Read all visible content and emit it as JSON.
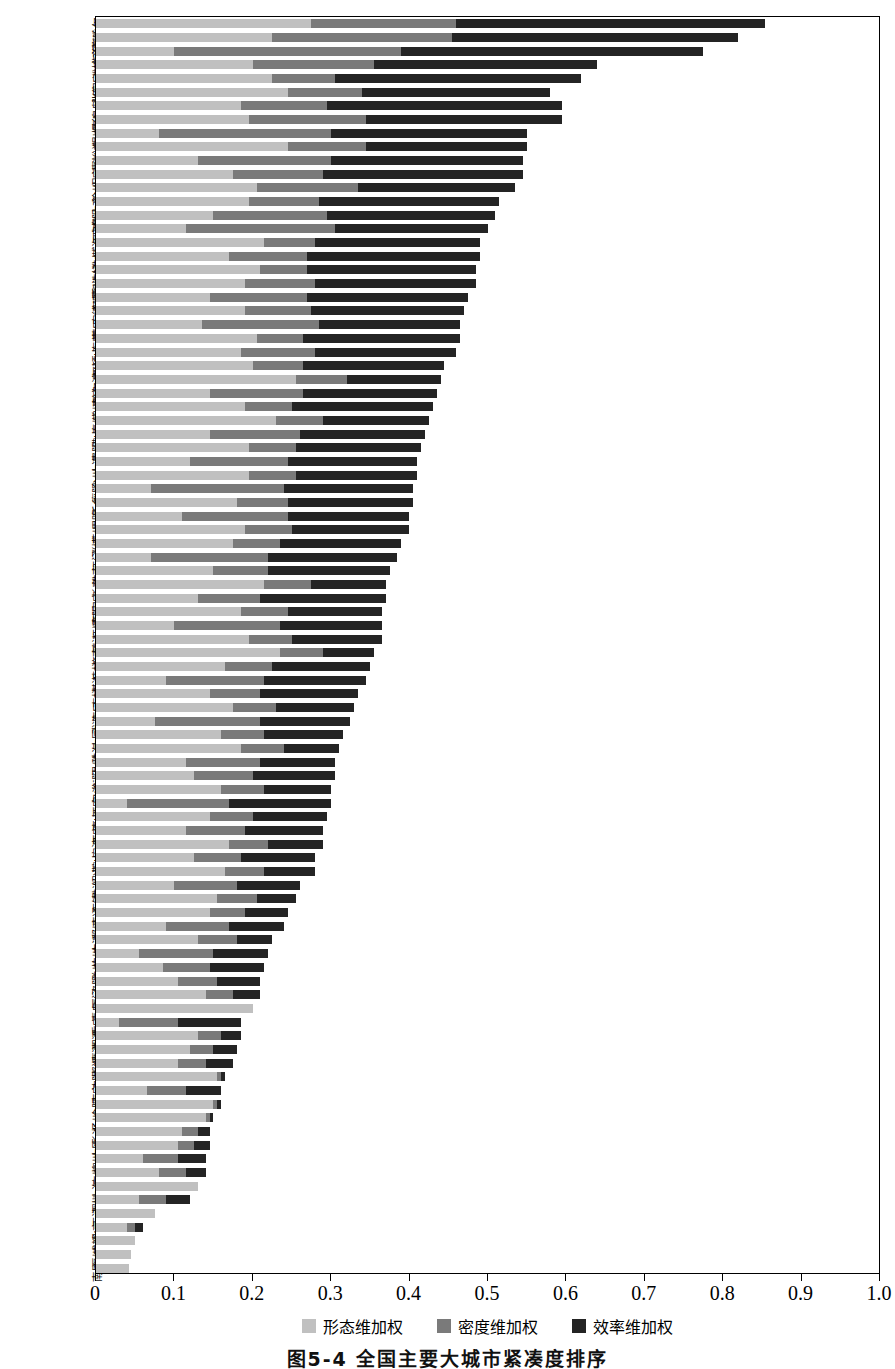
{
  "chart_data": {
    "type": "bar",
    "orientation": "horizontal",
    "stacked": true,
    "title": "图5-4 全国主要大城市紧凑度排序",
    "xlabel": "",
    "ylabel": "",
    "xlim": [
      0,
      1.0
    ],
    "grid": false,
    "legend_position": "bottom",
    "xticks": [
      "0",
      "0.1",
      "0.2",
      "0.3",
      "0.4",
      "0.5",
      "0.6",
      "0.7",
      "0.8",
      "0.9",
      "1.0"
    ],
    "xtick_values": [
      0,
      0.1,
      0.2,
      0.3,
      0.4,
      0.5,
      0.6,
      0.7,
      0.8,
      0.9,
      1.0
    ],
    "legend": [
      {
        "name": "形态维加权",
        "color": "#c0c0c0"
      },
      {
        "name": "密度维加权",
        "color": "#7a7a7a"
      },
      {
        "name": "效率维加权",
        "color": "#242424"
      }
    ],
    "series": [
      {
        "name": "形态维加权",
        "color": "#c0c0c0"
      },
      {
        "name": "密度维加权",
        "color": "#7a7a7a"
      },
      {
        "name": "效率维加权",
        "color": "#242424"
      }
    ],
    "categories": [
      "齐齐哈尔",
      "德州",
      "临沂",
      "潍坊",
      "张家口",
      "大庆",
      "秦皇岛",
      "烟台",
      "银川",
      "嘉峪关",
      "汕头",
      "保定",
      "徐州",
      "乌鲁木齐",
      "安阳",
      "开封",
      "威海",
      "淮北",
      "呼和浩特",
      "惠州",
      "东莞",
      "宁德",
      "营口",
      "东营",
      "平顶山",
      "中山",
      "哈尔滨",
      "枣庄",
      "常州",
      "泰州",
      "佛山",
      "贵阳",
      "大连",
      "台州",
      "襄阳",
      "新乡",
      "昆明",
      "苏州",
      "淄博",
      "江门",
      "淮南",
      "长春",
      "石家庄",
      "南阳",
      "抚顺",
      "镇江",
      "济南",
      "桂林",
      "湛江",
      "吉林",
      "海口",
      "武汉",
      "大同",
      "珠海",
      "温州",
      "衡阳",
      "包头",
      "西宁",
      "唐山",
      "西安",
      "宁波",
      "鞍山",
      "绍兴",
      "株洲",
      "无锡",
      "南通",
      "郑州",
      "本溪",
      "杭州",
      "兰州",
      "洛阳",
      "厦门",
      "青岛",
      "重庆",
      "湘潭",
      "鹰潭",
      "邯郸",
      "沈阳",
      "南宁",
      "合肥",
      "扬州",
      "长沙",
      "太原",
      "柳州",
      "广州",
      "上海",
      "深圳",
      "天津",
      "北京",
      "成都",
      "福州",
      "南昌"
    ],
    "rows": [
      {
        "label": "齐齐哈尔",
        "morphology": 0.275,
        "density": 0.185,
        "efficiency": 0.395,
        "total": 0.855
      },
      {
        "label": "德州",
        "morphology": 0.225,
        "density": 0.23,
        "efficiency": 0.365,
        "total": 0.82
      },
      {
        "label": "临沂",
        "morphology": 0.1,
        "density": 0.29,
        "efficiency": 0.385,
        "total": 0.775
      },
      {
        "label": "潍坊",
        "morphology": 0.2,
        "density": 0.155,
        "efficiency": 0.285,
        "total": 0.64
      },
      {
        "label": "张家口",
        "morphology": 0.225,
        "density": 0.08,
        "efficiency": 0.315,
        "total": 0.62
      },
      {
        "label": "大庆",
        "morphology": 0.245,
        "density": 0.095,
        "efficiency": 0.24,
        "total": 0.58
      },
      {
        "label": "秦皇岛",
        "morphology": 0.185,
        "density": 0.11,
        "efficiency": 0.3,
        "total": 0.595
      },
      {
        "label": "烟台",
        "morphology": 0.195,
        "density": 0.15,
        "efficiency": 0.25,
        "total": 0.595
      },
      {
        "label": "银川",
        "morphology": 0.08,
        "density": 0.22,
        "efficiency": 0.25,
        "total": 0.55
      },
      {
        "label": "嘉峪关",
        "morphology": 0.245,
        "density": 0.1,
        "efficiency": 0.205,
        "total": 0.55
      },
      {
        "label": "汕头",
        "morphology": 0.13,
        "density": 0.17,
        "efficiency": 0.245,
        "total": 0.545
      },
      {
        "label": "保定",
        "morphology": 0.175,
        "density": 0.115,
        "efficiency": 0.255,
        "total": 0.545
      },
      {
        "label": "徐州",
        "morphology": 0.205,
        "density": 0.13,
        "efficiency": 0.2,
        "total": 0.535
      },
      {
        "label": "乌鲁木齐",
        "morphology": 0.195,
        "density": 0.09,
        "efficiency": 0.23,
        "total": 0.515
      },
      {
        "label": "安阳",
        "morphology": 0.15,
        "density": 0.145,
        "efficiency": 0.215,
        "total": 0.51
      },
      {
        "label": "开封",
        "morphology": 0.115,
        "density": 0.19,
        "efficiency": 0.195,
        "total": 0.5
      },
      {
        "label": "威海",
        "morphology": 0.215,
        "density": 0.065,
        "efficiency": 0.21,
        "total": 0.49
      },
      {
        "label": "淮北",
        "morphology": 0.17,
        "density": 0.1,
        "efficiency": 0.22,
        "total": 0.49
      },
      {
        "label": "呼和浩特",
        "morphology": 0.21,
        "density": 0.06,
        "efficiency": 0.215,
        "total": 0.485
      },
      {
        "label": "惠州",
        "morphology": 0.19,
        "density": 0.09,
        "efficiency": 0.205,
        "total": 0.485
      },
      {
        "label": "东莞",
        "morphology": 0.145,
        "density": 0.125,
        "efficiency": 0.205,
        "total": 0.475
      },
      {
        "label": "宁德",
        "morphology": 0.19,
        "density": 0.085,
        "efficiency": 0.195,
        "total": 0.47
      },
      {
        "label": "营口",
        "morphology": 0.135,
        "density": 0.15,
        "efficiency": 0.18,
        "total": 0.465
      },
      {
        "label": "东营",
        "morphology": 0.205,
        "density": 0.06,
        "efficiency": 0.2,
        "total": 0.465
      },
      {
        "label": "平顶山",
        "morphology": 0.185,
        "density": 0.095,
        "efficiency": 0.18,
        "total": 0.46
      },
      {
        "label": "中山",
        "morphology": 0.2,
        "density": 0.065,
        "efficiency": 0.18,
        "total": 0.445
      },
      {
        "label": "哈尔滨",
        "morphology": 0.255,
        "density": 0.065,
        "efficiency": 0.12,
        "total": 0.44
      },
      {
        "label": "枣庄",
        "morphology": 0.145,
        "density": 0.12,
        "efficiency": 0.17,
        "total": 0.435
      },
      {
        "label": "常州",
        "morphology": 0.19,
        "density": 0.06,
        "efficiency": 0.18,
        "total": 0.43
      },
      {
        "label": "泰州",
        "morphology": 0.23,
        "density": 0.06,
        "efficiency": 0.135,
        "total": 0.425
      },
      {
        "label": "佛山",
        "morphology": 0.145,
        "density": 0.115,
        "efficiency": 0.16,
        "total": 0.42
      },
      {
        "label": "贵阳",
        "morphology": 0.195,
        "density": 0.06,
        "efficiency": 0.16,
        "total": 0.415
      },
      {
        "label": "大连",
        "morphology": 0.12,
        "density": 0.125,
        "efficiency": 0.165,
        "total": 0.41
      },
      {
        "label": "台州",
        "morphology": 0.195,
        "density": 0.06,
        "efficiency": 0.155,
        "total": 0.41
      },
      {
        "label": "襄阳",
        "morphology": 0.07,
        "density": 0.17,
        "efficiency": 0.165,
        "total": 0.405
      },
      {
        "label": "新乡",
        "morphology": 0.18,
        "density": 0.065,
        "efficiency": 0.16,
        "total": 0.405
      },
      {
        "label": "昆明",
        "morphology": 0.11,
        "density": 0.135,
        "efficiency": 0.155,
        "total": 0.4
      },
      {
        "label": "苏州",
        "morphology": 0.19,
        "density": 0.06,
        "efficiency": 0.15,
        "total": 0.4
      },
      {
        "label": "淄博",
        "morphology": 0.175,
        "density": 0.06,
        "efficiency": 0.155,
        "total": 0.39
      },
      {
        "label": "江门",
        "morphology": 0.07,
        "density": 0.15,
        "efficiency": 0.165,
        "total": 0.385
      },
      {
        "label": "淮南",
        "morphology": 0.15,
        "density": 0.07,
        "efficiency": 0.155,
        "total": 0.375
      },
      {
        "label": "长春",
        "morphology": 0.215,
        "density": 0.06,
        "efficiency": 0.095,
        "total": 0.37
      },
      {
        "label": "石家庄",
        "morphology": 0.13,
        "density": 0.08,
        "efficiency": 0.16,
        "total": 0.37
      },
      {
        "label": "南阳",
        "morphology": 0.185,
        "density": 0.06,
        "efficiency": 0.12,
        "total": 0.365
      },
      {
        "label": "抚顺",
        "morphology": 0.1,
        "density": 0.135,
        "efficiency": 0.13,
        "total": 0.365
      },
      {
        "label": "镇江",
        "morphology": 0.195,
        "density": 0.055,
        "efficiency": 0.115,
        "total": 0.365
      },
      {
        "label": "济南",
        "morphology": 0.235,
        "density": 0.055,
        "efficiency": 0.065,
        "total": 0.355
      },
      {
        "label": "桂林",
        "morphology": 0.165,
        "density": 0.06,
        "efficiency": 0.125,
        "total": 0.35
      },
      {
        "label": "湛江",
        "morphology": 0.09,
        "density": 0.125,
        "efficiency": 0.13,
        "total": 0.345
      },
      {
        "label": "吉林",
        "morphology": 0.145,
        "density": 0.065,
        "efficiency": 0.125,
        "total": 0.335
      },
      {
        "label": "海口",
        "morphology": 0.175,
        "density": 0.055,
        "efficiency": 0.1,
        "total": 0.33
      },
      {
        "label": "武汉",
        "morphology": 0.075,
        "density": 0.135,
        "efficiency": 0.115,
        "total": 0.325
      },
      {
        "label": "大同",
        "morphology": 0.16,
        "density": 0.055,
        "efficiency": 0.1,
        "total": 0.315
      },
      {
        "label": "珠海",
        "morphology": 0.185,
        "density": 0.055,
        "efficiency": 0.07,
        "total": 0.31
      },
      {
        "label": "温州",
        "morphology": 0.115,
        "density": 0.095,
        "efficiency": 0.095,
        "total": 0.305
      },
      {
        "label": "衡阳",
        "morphology": 0.125,
        "density": 0.075,
        "efficiency": 0.105,
        "total": 0.305
      },
      {
        "label": "包头",
        "morphology": 0.16,
        "density": 0.055,
        "efficiency": 0.085,
        "total": 0.3
      },
      {
        "label": "西宁",
        "morphology": 0.04,
        "density": 0.13,
        "efficiency": 0.13,
        "total": 0.3
      },
      {
        "label": "唐山",
        "morphology": 0.145,
        "density": 0.055,
        "efficiency": 0.095,
        "total": 0.295
      },
      {
        "label": "西安",
        "morphology": 0.115,
        "density": 0.075,
        "efficiency": 0.1,
        "total": 0.29
      },
      {
        "label": "宁波",
        "morphology": 0.17,
        "density": 0.05,
        "efficiency": 0.07,
        "total": 0.29
      },
      {
        "label": "鞍山",
        "morphology": 0.125,
        "density": 0.06,
        "efficiency": 0.095,
        "total": 0.28
      },
      {
        "label": "绍兴",
        "morphology": 0.165,
        "density": 0.05,
        "efficiency": 0.065,
        "total": 0.28
      },
      {
        "label": "株洲",
        "morphology": 0.1,
        "density": 0.08,
        "efficiency": 0.08,
        "total": 0.26
      },
      {
        "label": "无锡",
        "morphology": 0.155,
        "density": 0.05,
        "efficiency": 0.05,
        "total": 0.255
      },
      {
        "label": "南通",
        "morphology": 0.145,
        "density": 0.045,
        "efficiency": 0.055,
        "total": 0.245
      },
      {
        "label": "郑州",
        "morphology": 0.09,
        "density": 0.08,
        "efficiency": 0.07,
        "total": 0.24
      },
      {
        "label": "本溪",
        "morphology": 0.13,
        "density": 0.05,
        "efficiency": 0.045,
        "total": 0.225
      },
      {
        "label": "杭州",
        "morphology": 0.055,
        "density": 0.095,
        "efficiency": 0.07,
        "total": 0.22
      },
      {
        "label": "兰州",
        "morphology": 0.085,
        "density": 0.06,
        "efficiency": 0.07,
        "total": 0.215
      },
      {
        "label": "洛阳",
        "morphology": 0.105,
        "density": 0.05,
        "efficiency": 0.055,
        "total": 0.21
      },
      {
        "label": "厦门",
        "morphology": 0.14,
        "density": 0.035,
        "efficiency": 0.035,
        "total": 0.21
      },
      {
        "label": "青岛",
        "morphology": 0.2,
        "density": 0.0,
        "efficiency": 0.0,
        "total": 0.2
      },
      {
        "label": "重庆",
        "morphology": 0.03,
        "density": 0.075,
        "efficiency": 0.08,
        "total": 0.185
      },
      {
        "label": "湘潭",
        "morphology": 0.13,
        "density": 0.03,
        "efficiency": 0.025,
        "total": 0.185
      },
      {
        "label": "鹰潭",
        "morphology": 0.12,
        "density": 0.03,
        "efficiency": 0.03,
        "total": 0.18
      },
      {
        "label": "邯郸",
        "morphology": 0.105,
        "density": 0.035,
        "efficiency": 0.035,
        "total": 0.175
      },
      {
        "label": "沈阳",
        "morphology": 0.155,
        "density": 0.005,
        "efficiency": 0.005,
        "total": 0.165
      },
      {
        "label": "南宁",
        "morphology": 0.065,
        "density": 0.05,
        "efficiency": 0.045,
        "total": 0.16
      },
      {
        "label": "合肥",
        "morphology": 0.15,
        "density": 0.005,
        "efficiency": 0.005,
        "total": 0.16
      },
      {
        "label": "扬州",
        "morphology": 0.14,
        "density": 0.005,
        "efficiency": 0.005,
        "total": 0.15
      },
      {
        "label": "长沙",
        "morphology": 0.11,
        "density": 0.02,
        "efficiency": 0.015,
        "total": 0.145
      },
      {
        "label": "太原",
        "morphology": 0.105,
        "density": 0.02,
        "efficiency": 0.02,
        "total": 0.145
      },
      {
        "label": "柳州",
        "morphology": 0.06,
        "density": 0.045,
        "efficiency": 0.035,
        "total": 0.14
      },
      {
        "label": "广州",
        "morphology": 0.08,
        "density": 0.035,
        "efficiency": 0.025,
        "total": 0.14
      },
      {
        "label": "上海",
        "morphology": 0.13,
        "density": 0.0,
        "efficiency": 0.0,
        "total": 0.13
      },
      {
        "label": "深圳",
        "morphology": 0.055,
        "density": 0.035,
        "efficiency": 0.03,
        "total": 0.12
      },
      {
        "label": "天津",
        "morphology": 0.075,
        "density": 0.0,
        "efficiency": 0.0,
        "total": 0.075
      },
      {
        "label": "北京",
        "morphology": 0.04,
        "density": 0.01,
        "efficiency": 0.01,
        "total": 0.06
      },
      {
        "label": "成都",
        "morphology": 0.05,
        "density": 0.0,
        "efficiency": 0.0,
        "total": 0.05
      },
      {
        "label": "福州",
        "morphology": 0.045,
        "density": 0.0,
        "efficiency": 0.0,
        "total": 0.045
      },
      {
        "label": "南昌",
        "morphology": 0.042,
        "density": 0.0,
        "efficiency": 0.0,
        "total": 0.042
      }
    ]
  },
  "caption": {
    "text": "图5-4 全国主要大城市紧凑度排序"
  }
}
